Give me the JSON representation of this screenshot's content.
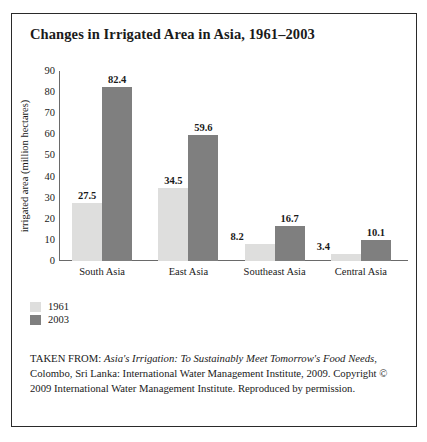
{
  "figure": {
    "title": "Changes in Irrigated Area in Asia, 1961–2003"
  },
  "legend": {
    "items": [
      {
        "label": "1961",
        "color": "#dededd"
      },
      {
        "label": "2003",
        "color": "#7f7f7f"
      }
    ]
  },
  "source": {
    "prefix": "TAKEN FROM: ",
    "work_title": "Asia's Irrigation: To Sustainably Meet Tomorrow's Food Needs",
    "rest": ", Colombo, Sri Lanka: International Water Management Institute, 2009. Copyright © 2009 International Water Management Institute. Reproduced by permission."
  },
  "chart_data": {
    "type": "bar",
    "title": "Changes in Irrigated Area in Asia, 1961–2003",
    "xlabel": "",
    "ylabel": "irrigated area (million hectares)",
    "ylim": [
      0,
      90
    ],
    "yticks": [
      90,
      80,
      70,
      60,
      50,
      40,
      30,
      20,
      10,
      0
    ],
    "grid": false,
    "legend_position": "below-left",
    "categories": [
      "South Asia",
      "East Asia",
      "Southeast Asia",
      "Central Asia"
    ],
    "series": [
      {
        "name": "1961",
        "color": "#dededd",
        "values": [
          27.5,
          34.5,
          8.2,
          3.4
        ]
      },
      {
        "name": "2003",
        "color": "#7f7f7f",
        "values": [
          82.4,
          59.6,
          16.7,
          10.1
        ]
      }
    ]
  }
}
